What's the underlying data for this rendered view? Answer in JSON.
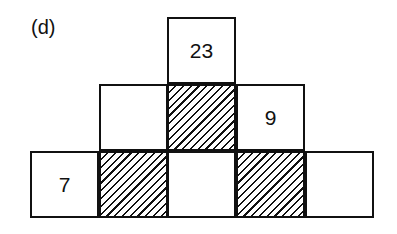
{
  "label": "(d)",
  "rows": [
    {
      "cells": [
        {
          "value": "23",
          "hatched": false
        }
      ]
    },
    {
      "cells": [
        {
          "value": "",
          "hatched": false
        },
        {
          "value": "",
          "hatched": true
        },
        {
          "value": "9",
          "hatched": false
        }
      ]
    },
    {
      "cells": [
        {
          "value": "7",
          "hatched": false
        },
        {
          "value": "",
          "hatched": true
        },
        {
          "value": "",
          "hatched": false
        },
        {
          "value": "",
          "hatched": true
        },
        {
          "value": "",
          "hatched": false
        }
      ]
    }
  ]
}
